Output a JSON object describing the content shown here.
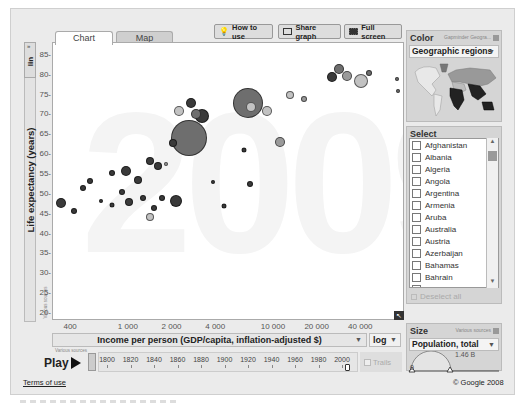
{
  "tabs": [
    {
      "label": "Chart",
      "active": true
    },
    {
      "label": "Map",
      "active": false
    }
  ],
  "toolbar": {
    "how_to_use": "How to use",
    "share_graph": "Share graph",
    "full_screen": "Full screen"
  },
  "y_axis": {
    "scale_toggle": "lin",
    "title": "Life expectancy (years)",
    "source_note": "Various sources"
  },
  "x_axis": {
    "title": "Income per person (GDP/capita, inflation-adjusted $)",
    "scale": "log",
    "source_note": "Various sources"
  },
  "year_watermark": "2009",
  "color_panel": {
    "title": "Color",
    "source_note": "Gapminder Geogra...",
    "selected": "Geographic regions"
  },
  "select_panel": {
    "title": "Select",
    "items": [
      "Afghanistan",
      "Albania",
      "Algeria",
      "Angola",
      "Argentina",
      "Armenia",
      "Aruba",
      "Australia",
      "Austria",
      "Azerbaijan",
      "Bahamas",
      "Bahrain",
      "Bangladesh"
    ],
    "deselect_all": "Deselect all"
  },
  "size_panel": {
    "title": "Size",
    "source_note": "Various sources",
    "selected": "Population, total",
    "min_label": "0",
    "max_label": "1.46 B"
  },
  "timeline": {
    "play_label": "Play",
    "years": [
      "1800",
      "1820",
      "1840",
      "1860",
      "1880",
      "1900",
      "1920",
      "1940",
      "1960",
      "1980",
      "2000"
    ],
    "trails_label": "Trails"
  },
  "footer": {
    "terms": "Terms of use",
    "copyright": "© Google 2008"
  },
  "colors": {
    "africa": "#3a3a3a",
    "asia": "#6e6e6e",
    "europe": "#9a9a9a",
    "americas": "#c2c2c2",
    "background": "#ebebeb"
  },
  "chart_data": {
    "type": "scatter",
    "title": "",
    "xlabel": "Income per person (GDP/capita, inflation-adjusted $)",
    "ylabel": "Life expectancy (years)",
    "x_scale": "log",
    "xlim": [
      300,
      80000
    ],
    "ylim": [
      18,
      88
    ],
    "x_ticks": [
      400,
      1000,
      2000,
      4000,
      10000,
      20000,
      40000
    ],
    "x_tick_labels": [
      "400",
      "1 000",
      "2 000",
      "4 000",
      "10 000",
      "20 000",
      "40 000"
    ],
    "y_ticks": [
      20,
      25,
      30,
      35,
      40,
      45,
      50,
      55,
      60,
      65,
      70,
      75,
      80,
      85
    ],
    "grid": false,
    "year": "2009",
    "size_by": "Population, total",
    "color_by": "Geographic regions",
    "points": [
      {
        "x": 340,
        "y": 47.8,
        "r": 5,
        "c": "africa"
      },
      {
        "x": 420,
        "y": 45.7,
        "r": 3,
        "c": "africa"
      },
      {
        "x": 480,
        "y": 51.5,
        "r": 3,
        "c": "africa"
      },
      {
        "x": 540,
        "y": 53.2,
        "r": 3,
        "c": "africa"
      },
      {
        "x": 640,
        "y": 48.1,
        "r": 2,
        "c": "africa"
      },
      {
        "x": 760,
        "y": 47.3,
        "r": 2.5,
        "c": "africa"
      },
      {
        "x": 760,
        "y": 55.2,
        "r": 3,
        "c": "africa"
      },
      {
        "x": 900,
        "y": 50.5,
        "r": 3,
        "c": "africa"
      },
      {
        "x": 960,
        "y": 55.8,
        "r": 5,
        "c": "africa"
      },
      {
        "x": 1000,
        "y": 48.0,
        "r": 4,
        "c": "africa"
      },
      {
        "x": 1150,
        "y": 53.6,
        "r": 4,
        "c": "africa"
      },
      {
        "x": 1250,
        "y": 48.9,
        "r": 3,
        "c": "africa"
      },
      {
        "x": 1400,
        "y": 58.2,
        "r": 4,
        "c": "africa"
      },
      {
        "x": 1400,
        "y": 44.2,
        "r": 4,
        "c": "americas"
      },
      {
        "x": 1500,
        "y": 46.4,
        "r": 3,
        "c": "africa"
      },
      {
        "x": 1600,
        "y": 57.0,
        "r": 4,
        "c": "africa"
      },
      {
        "x": 1700,
        "y": 49.0,
        "r": 3,
        "c": "africa"
      },
      {
        "x": 2100,
        "y": 48.2,
        "r": 6,
        "c": "africa"
      },
      {
        "x": 1800,
        "y": 57.6,
        "r": 2,
        "c": "europe"
      },
      {
        "x": 2000,
        "y": 62.8,
        "r": 4,
        "c": "africa"
      },
      {
        "x": 2600,
        "y": 64.0,
        "r": 18,
        "c": "asia"
      },
      {
        "x": 2200,
        "y": 71.0,
        "r": 5,
        "c": "americas"
      },
      {
        "x": 2700,
        "y": 73.0,
        "r": 5,
        "c": "africa"
      },
      {
        "x": 3200,
        "y": 69.5,
        "r": 7,
        "c": "africa"
      },
      {
        "x": 2900,
        "y": 70.0,
        "r": 5,
        "c": "asia"
      },
      {
        "x": 4500,
        "y": 47.0,
        "r": 2.5,
        "c": "africa"
      },
      {
        "x": 3800,
        "y": 53.0,
        "r": 2,
        "c": "africa"
      },
      {
        "x": 6600,
        "y": 73.0,
        "r": 15,
        "c": "asia"
      },
      {
        "x": 6800,
        "y": 52.5,
        "r": 3,
        "c": "africa"
      },
      {
        "x": 6200,
        "y": 61.0,
        "r": 2.5,
        "c": "africa"
      },
      {
        "x": 7000,
        "y": 72.0,
        "r": 5,
        "c": "americas"
      },
      {
        "x": 9000,
        "y": 71.0,
        "r": 5,
        "c": "americas"
      },
      {
        "x": 11000,
        "y": 63.0,
        "r": 5,
        "c": "europe"
      },
      {
        "x": 13000,
        "y": 75.0,
        "r": 4,
        "c": "americas"
      },
      {
        "x": 16000,
        "y": 74.0,
        "r": 3,
        "c": "europe"
      },
      {
        "x": 25000,
        "y": 79.5,
        "r": 5,
        "c": "africa"
      },
      {
        "x": 28000,
        "y": 81.5,
        "r": 5,
        "c": "asia"
      },
      {
        "x": 32000,
        "y": 79.8,
        "r": 5,
        "c": "europe"
      },
      {
        "x": 40000,
        "y": 78.5,
        "r": 7,
        "c": "americas"
      },
      {
        "x": 45000,
        "y": 80.5,
        "r": 3,
        "c": "asia"
      },
      {
        "x": 70000,
        "y": 79.0,
        "r": 2,
        "c": "asia"
      },
      {
        "x": 72000,
        "y": 76.0,
        "r": 2,
        "c": "asia"
      }
    ]
  }
}
